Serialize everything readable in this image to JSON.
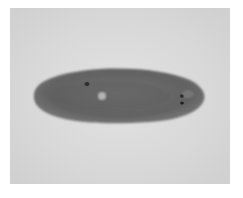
{
  "image": {
    "subject": "flatworm",
    "description": "Grayscale micrograph of a planarian flatworm on a light gray background",
    "colors": {
      "background": "#ffffff",
      "photo_background": "#d8d8d8",
      "body": "#6e6e6e",
      "body_dark": "#5a5a5a",
      "eyespots": "#202020",
      "pharynx_highlight": "#b8b8b8"
    }
  }
}
